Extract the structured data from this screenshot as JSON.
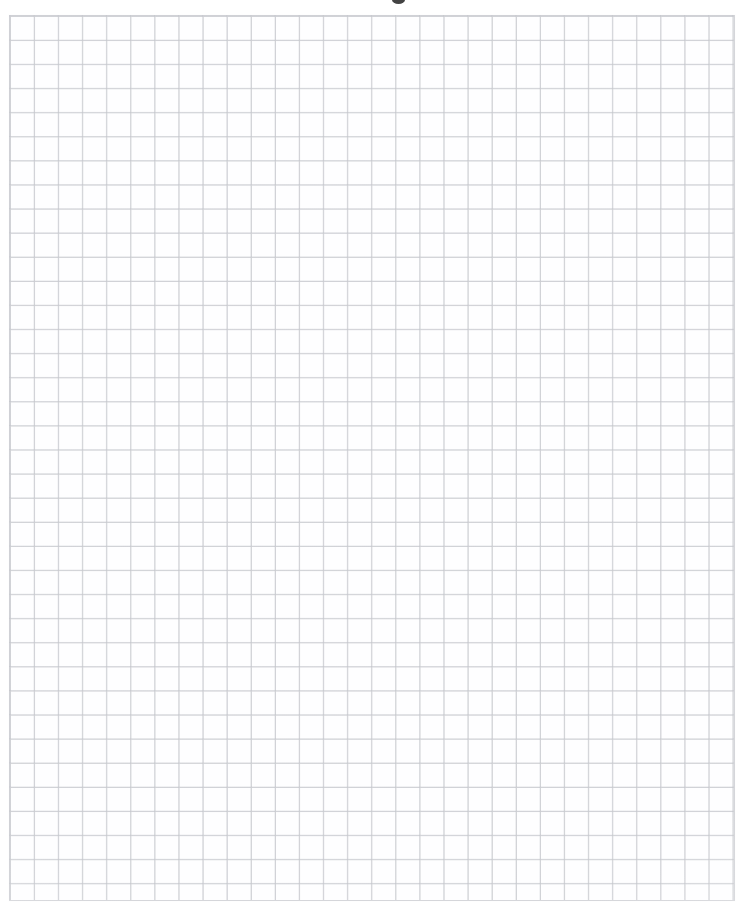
{
  "document": {
    "kind": "scanned-graph-paper",
    "description": "Blank quadrille / graph paper sheet, scanned",
    "visible_text": "",
    "page_width_px": 748,
    "page_height_px": 909
  },
  "colors": {
    "page_background": "#ffffff",
    "paper": "#fefefe",
    "grid_line": "#d5d6da",
    "grid_line_soft": "#bec0c6",
    "smudge": "#2a2a2a"
  },
  "grid": {
    "origin_x_px": 9,
    "origin_y_px": 15,
    "right_edge_x_px": 734,
    "bottom_edge_y_px": 900,
    "width_px": 726,
    "height_px": 886,
    "cell_size_px": 24.1,
    "columns": 30,
    "rows": 37,
    "line_width_px": 1,
    "style": "uniform-square-quadrille"
  },
  "margins": {
    "top_px": 14,
    "left_px": 8,
    "right_px": 12,
    "bottom_px": 7
  },
  "artifacts": {
    "smudge": {
      "name": "scan-smudge",
      "x_px": 392,
      "y_px": 0,
      "width_px": 13,
      "height_px": 8
    }
  }
}
